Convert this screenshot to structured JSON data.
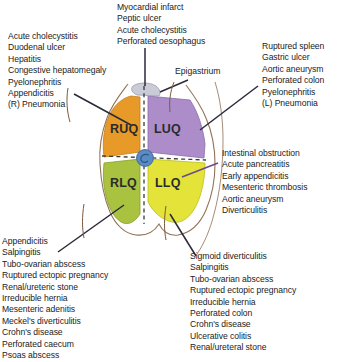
{
  "diagram": {
    "title_region_labels": {
      "epigastrium": "Epigastrium"
    },
    "quadrants": [
      {
        "id": "RUQ",
        "label": "RUQ",
        "color": "#E89A28",
        "name": "right-upper-quadrant"
      },
      {
        "id": "LUQ",
        "label": "LUQ",
        "color": "#A98BC8",
        "name": "left-upper-quadrant"
      },
      {
        "id": "RLQ",
        "label": "RLQ",
        "color": "#A9C23F",
        "name": "right-lower-quadrant"
      },
      {
        "id": "LLQ",
        "label": "LLQ",
        "color": "#E3E33A",
        "name": "left-lower-quadrant"
      }
    ],
    "epigastrium_color": "#C9CBD6",
    "umbilicus_color": "#5B8BC4",
    "outline_color": "#8B5E3C",
    "leader_line_color": "#2a2a3a"
  },
  "blocks": {
    "top_center": {
      "name": "epigastric-causes",
      "items": [
        "Myocardial infarct",
        "Peptic ulcer",
        "Acute cholecystitis",
        "Perforated oesophagus"
      ]
    },
    "top_left": {
      "name": "right-upper-quadrant-causes",
      "items": [
        "Acute cholecystitis",
        "Duodenal ulcer",
        "Hepatitis",
        "Congestive hepatomegaly",
        "Pyelonephritis",
        "Appendicitis",
        "(R) Pneumonia"
      ]
    },
    "top_right": {
      "name": "left-upper-quadrant-causes",
      "items": [
        "Ruptured spleen",
        "Gastric ulcer",
        "Aortic aneurysm",
        "Perforated colon",
        "Pyelonephritis",
        "(L) Pneumonia"
      ]
    },
    "mid_right": {
      "name": "periumbilical-causes",
      "items": [
        "Intestinal obstruction",
        "Acute pancreatitis",
        "Early appendicitis",
        "Mesenteric thrombosis",
        "Aortic aneurysm",
        "Diverticulitis"
      ]
    },
    "bottom_left": {
      "name": "right-lower-quadrant-causes",
      "items": [
        "Appendicitis",
        "Salpingitis",
        "Tubo-ovarian abscess",
        "Ruptured ectopic pregnancy",
        "Renal/ureteric stone",
        "Irreducible hernia",
        "Mesenteric adenitis",
        "Meckel's diverticulitis",
        "Crohn's disease",
        "Perforated caecum",
        "Psoas abscess"
      ]
    },
    "bottom_right": {
      "name": "left-lower-quadrant-causes",
      "items": [
        "Sigmoid diverticulitis",
        "Salpingitis",
        "Tubo-ovarian abscess",
        "Ruptured ectopic pregnancy",
        "Irreducible hernia",
        "Perforated colon",
        "Crohn's disease",
        "Ulcerative colitis",
        "Renal/ureteral stone"
      ]
    }
  }
}
